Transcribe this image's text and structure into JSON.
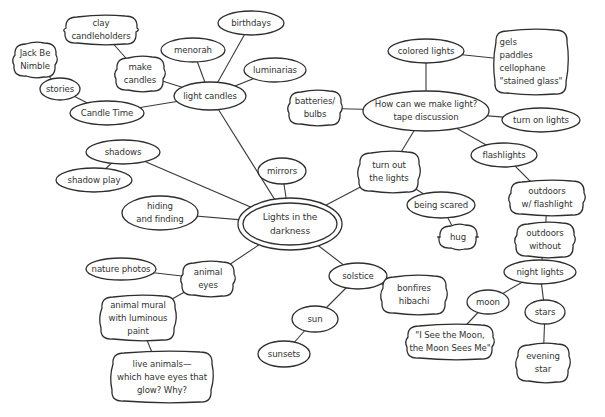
{
  "diagram": {
    "title": "Lights in the darkness",
    "colors": {
      "stroke": "#2e2e2e",
      "text": "#333333",
      "background": "#ffffff"
    },
    "nodes": [
      {
        "id": "center",
        "label": "Lights in the\ndarkness",
        "x": 290,
        "y": 224,
        "rx": 52,
        "ry": 26,
        "shape": "double-ellipse"
      },
      {
        "id": "light-candles",
        "label": "light candles",
        "x": 210,
        "y": 96,
        "rx": 36,
        "ry": 14,
        "shape": "ellipse"
      },
      {
        "id": "make-candles",
        "label": "make\ncandles",
        "x": 140,
        "y": 74,
        "rx": 24,
        "ry": 17,
        "shape": "blob"
      },
      {
        "id": "clay-candleholders",
        "label": "clay\ncandleholders",
        "x": 101,
        "y": 30,
        "rx": 36,
        "ry": 14,
        "shape": "blob"
      },
      {
        "id": "menorah",
        "label": "menorah",
        "x": 193,
        "y": 50,
        "rx": 32,
        "ry": 12,
        "shape": "ellipse"
      },
      {
        "id": "birthdays",
        "label": "birthdays",
        "x": 251,
        "y": 23,
        "rx": 33,
        "ry": 12,
        "shape": "ellipse"
      },
      {
        "id": "luminarias",
        "label": "luminarias",
        "x": 275,
        "y": 70,
        "rx": 31,
        "ry": 12,
        "shape": "ellipse"
      },
      {
        "id": "candle-time",
        "label": "Candle Time",
        "x": 107,
        "y": 113,
        "rx": 37,
        "ry": 12,
        "shape": "ellipse"
      },
      {
        "id": "stories",
        "label": "stories",
        "x": 60,
        "y": 89,
        "rx": 20,
        "ry": 11,
        "shape": "ellipse"
      },
      {
        "id": "jack-be-nimble",
        "label": "Jack Be\nNimble",
        "x": 35,
        "y": 60,
        "rx": 21,
        "ry": 17,
        "shape": "blob"
      },
      {
        "id": "how-can-we-make-light",
        "label": "How can we make light?\ntape discussion",
        "x": 426,
        "y": 111,
        "rx": 63,
        "ry": 20,
        "shape": "ellipse"
      },
      {
        "id": "batteries-bulbs",
        "label": "batteries/\nbulbs",
        "x": 315,
        "y": 108,
        "rx": 26,
        "ry": 17,
        "shape": "blob"
      },
      {
        "id": "colored-lights",
        "label": "colored lights",
        "x": 426,
        "y": 51,
        "rx": 38,
        "ry": 12,
        "shape": "ellipse"
      },
      {
        "id": "gels-list",
        "label": "gels\npaddles\ncellophane\n\"stained glass\"",
        "x": 531,
        "y": 62,
        "rx": 36,
        "ry": 32,
        "shape": "blob",
        "align": "left"
      },
      {
        "id": "turn-on-lights",
        "label": "turn on lights",
        "x": 541,
        "y": 120,
        "rx": 39,
        "ry": 12,
        "shape": "ellipse"
      },
      {
        "id": "flashlights",
        "label": "flashlights",
        "x": 504,
        "y": 155,
        "rx": 33,
        "ry": 12,
        "shape": "ellipse"
      },
      {
        "id": "outdoors-flashlight",
        "label": "outdoors\nw/ flashlight",
        "x": 547,
        "y": 198,
        "rx": 37,
        "ry": 17,
        "shape": "blob"
      },
      {
        "id": "outdoors-without",
        "label": "outdoors\nwithout",
        "x": 545,
        "y": 240,
        "rx": 29,
        "ry": 17,
        "shape": "blob"
      },
      {
        "id": "night-lights",
        "label": "night lights",
        "x": 540,
        "y": 272,
        "rx": 36,
        "ry": 12,
        "shape": "ellipse"
      },
      {
        "id": "moon",
        "label": "moon",
        "x": 488,
        "y": 302,
        "rx": 21,
        "ry": 12,
        "shape": "ellipse"
      },
      {
        "id": "stars",
        "label": "stars",
        "x": 545,
        "y": 312,
        "rx": 20,
        "ry": 12,
        "shape": "ellipse"
      },
      {
        "id": "evening-star",
        "label": "evening\nstar",
        "x": 543,
        "y": 363,
        "rx": 26,
        "ry": 19,
        "shape": "blob"
      },
      {
        "id": "i-see-the-moon",
        "label": "\"I See the Moon,\nthe Moon Sees Me\"",
        "x": 450,
        "y": 342,
        "rx": 43,
        "ry": 17,
        "shape": "blob"
      },
      {
        "id": "turn-out-the-lights",
        "label": "turn out\nthe lights",
        "x": 389,
        "y": 172,
        "rx": 30,
        "ry": 20,
        "shape": "blob"
      },
      {
        "id": "being-scared",
        "label": "being scared",
        "x": 441,
        "y": 205,
        "rx": 34,
        "ry": 13,
        "shape": "ellipse"
      },
      {
        "id": "hug",
        "label": "hug",
        "x": 458,
        "y": 237,
        "rx": 19,
        "ry": 12,
        "shape": "blob"
      },
      {
        "id": "mirrors",
        "label": "mirrors",
        "x": 282,
        "y": 171,
        "rx": 24,
        "ry": 13,
        "shape": "ellipse"
      },
      {
        "id": "shadows",
        "label": "shadows",
        "x": 123,
        "y": 152,
        "rx": 37,
        "ry": 12,
        "shape": "ellipse"
      },
      {
        "id": "shadow-play",
        "label": "shadow play",
        "x": 94,
        "y": 180,
        "rx": 38,
        "ry": 12,
        "shape": "ellipse"
      },
      {
        "id": "hiding-and-finding",
        "label": "hiding\nand finding",
        "x": 160,
        "y": 213,
        "rx": 38,
        "ry": 17,
        "shape": "ellipse"
      },
      {
        "id": "animal-eyes",
        "label": "animal\neyes",
        "x": 208,
        "y": 279,
        "rx": 26,
        "ry": 17,
        "shape": "blob"
      },
      {
        "id": "nature-photos",
        "label": "nature photos",
        "x": 121,
        "y": 269,
        "rx": 35,
        "ry": 11,
        "shape": "ellipse"
      },
      {
        "id": "animal-mural",
        "label": "animal mural\nwith luminous\npaint",
        "x": 138,
        "y": 318,
        "rx": 37,
        "ry": 22,
        "shape": "blob"
      },
      {
        "id": "live-animals",
        "label": "live animals—\nwhich have eyes that\nglow? Why?",
        "x": 162,
        "y": 377,
        "rx": 50,
        "ry": 25,
        "shape": "blob"
      },
      {
        "id": "solstice",
        "label": "solstice",
        "x": 358,
        "y": 276,
        "rx": 29,
        "ry": 13,
        "shape": "ellipse"
      },
      {
        "id": "bonfires-hibachi",
        "label": "bonfires\nhibachi",
        "x": 414,
        "y": 295,
        "rx": 32,
        "ry": 19,
        "shape": "blob"
      },
      {
        "id": "sun",
        "label": "sun",
        "x": 315,
        "y": 319,
        "rx": 23,
        "ry": 13,
        "shape": "ellipse"
      },
      {
        "id": "sunsets",
        "label": "sunsets",
        "x": 284,
        "y": 354,
        "rx": 26,
        "ry": 13,
        "shape": "ellipse"
      }
    ],
    "edges": [
      [
        "center",
        "light-candles"
      ],
      [
        "light-candles",
        "make-candles"
      ],
      [
        "make-candles",
        "clay-candleholders"
      ],
      [
        "light-candles",
        "menorah"
      ],
      [
        "light-candles",
        "birthdays"
      ],
      [
        "light-candles",
        "luminarias"
      ],
      [
        "light-candles",
        "candle-time"
      ],
      [
        "candle-time",
        "stories"
      ],
      [
        "stories",
        "jack-be-nimble"
      ],
      [
        "center",
        "turn-out-the-lights"
      ],
      [
        "turn-out-the-lights",
        "how-can-we-make-light"
      ],
      [
        "how-can-we-make-light",
        "batteries-bulbs"
      ],
      [
        "how-can-we-make-light",
        "colored-lights"
      ],
      [
        "colored-lights",
        "gels-list"
      ],
      [
        "how-can-we-make-light",
        "turn-on-lights"
      ],
      [
        "how-can-we-make-light",
        "flashlights"
      ],
      [
        "flashlights",
        "outdoors-flashlight"
      ],
      [
        "outdoors-flashlight",
        "outdoors-without"
      ],
      [
        "outdoors-without",
        "night-lights"
      ],
      [
        "night-lights",
        "moon"
      ],
      [
        "night-lights",
        "stars"
      ],
      [
        "stars",
        "evening-star"
      ],
      [
        "moon",
        "i-see-the-moon"
      ],
      [
        "turn-out-the-lights",
        "being-scared"
      ],
      [
        "being-scared",
        "hug"
      ],
      [
        "center",
        "mirrors"
      ],
      [
        "center",
        "shadows"
      ],
      [
        "shadows",
        "shadow-play"
      ],
      [
        "center",
        "hiding-and-finding"
      ],
      [
        "center",
        "animal-eyes"
      ],
      [
        "animal-eyes",
        "nature-photos"
      ],
      [
        "animal-eyes",
        "animal-mural"
      ],
      [
        "animal-mural",
        "live-animals"
      ],
      [
        "center",
        "solstice"
      ],
      [
        "solstice",
        "bonfires-hibachi"
      ],
      [
        "solstice",
        "sun"
      ],
      [
        "sun",
        "sunsets"
      ]
    ]
  }
}
